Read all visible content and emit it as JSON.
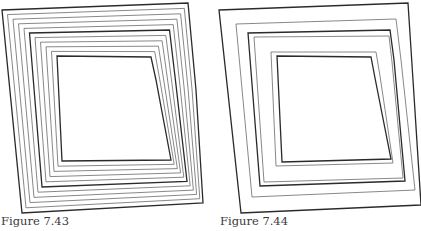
{
  "figures": [
    {
      "id": "left",
      "caption": "Figure 7.43",
      "description": "Nested offset contours of a quadrilateral, many evenly spaced rings",
      "ring_count": 11
    },
    {
      "id": "right",
      "caption": "Figure 7.44",
      "description": "Nested offset contours of a quadrilateral, fewer unevenly spaced rings",
      "ring_count": 6
    }
  ],
  "colors": {
    "stroke_bold": "#2a2a2a",
    "stroke_thin": "#6a6a6a",
    "background": "#ffffff"
  }
}
